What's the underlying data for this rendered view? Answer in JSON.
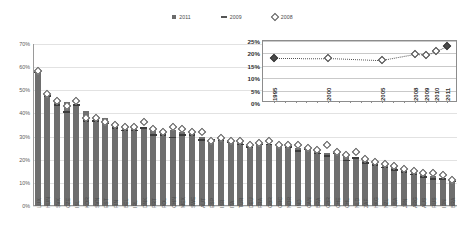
{
  "legend": {
    "items": [
      {
        "label": "2011",
        "marker": "bar-swatch"
      },
      {
        "label": "2009",
        "marker": "dash-marker"
      },
      {
        "label": "2008",
        "marker": "diamond-marker"
      }
    ]
  },
  "chart_data": {
    "type": "bar",
    "title": "",
    "xlabel": "",
    "ylabel": "",
    "ylim": [
      0,
      70
    ],
    "ytick_labels": [
      "0%",
      "10%",
      "20%",
      "30%",
      "40%",
      "50%",
      "60%",
      "70%"
    ],
    "ytick_values": [
      0,
      10,
      20,
      30,
      40,
      50,
      60,
      70
    ],
    "grid": true,
    "legend_position": "top-center",
    "categories": [
      "LUX",
      "HUN",
      "SVK",
      "CZE",
      "ISL",
      "KOR",
      "SVN",
      "EST",
      "FIN",
      "BEL",
      "IRL",
      "DNK",
      "PRT",
      "POL",
      "CHN",
      "MEX",
      "SWE",
      "AUT",
      "ESP",
      "ISR",
      "ITA",
      "TUR",
      "DEU",
      "FRA",
      "GBR",
      "GRC",
      "NOR",
      "IND",
      "CAN",
      "BRA2",
      "GBR2",
      "CHE",
      "CHL",
      "NLD",
      "ZAF",
      "HKG",
      "NZL",
      "USA",
      "JPN",
      "ARG",
      "AUS",
      "RUS",
      "IDN",
      "BRA"
    ],
    "series": [
      {
        "name": "2011",
        "type": "bar",
        "values": [
          58,
          49,
          46,
          45,
          44,
          41,
          39,
          38,
          36,
          35,
          35,
          34,
          34,
          33,
          33,
          32,
          32,
          30,
          29,
          29,
          28,
          28,
          27,
          27,
          27,
          26,
          26,
          25,
          25,
          24,
          23,
          23,
          22,
          21,
          20,
          18,
          18,
          17,
          16,
          15,
          14,
          13,
          12,
          11
        ]
      },
      {
        "name": "2009",
        "type": "dash",
        "values": [
          58,
          48,
          44,
          41,
          44,
          37,
          37,
          36,
          34,
          33,
          33,
          34,
          31,
          31,
          30,
          31,
          31,
          29,
          29,
          29,
          28,
          27,
          26,
          27,
          27,
          27,
          26,
          24,
          25,
          23,
          22,
          23,
          20,
          21,
          19,
          18,
          17,
          16,
          15,
          14,
          13,
          12,
          12,
          11
        ]
      },
      {
        "name": "2008",
        "type": "diamond",
        "values": [
          60,
          50,
          47,
          45,
          47,
          40,
          40,
          38,
          37,
          36,
          36,
          38,
          35,
          34,
          36,
          35,
          34,
          34,
          30,
          31,
          30,
          30,
          28,
          29,
          30,
          28,
          28,
          28,
          27,
          26,
          28,
          25,
          24,
          25,
          22,
          21,
          20,
          19,
          18,
          17,
          16,
          16,
          15,
          13
        ]
      }
    ],
    "inset": {
      "type": "line",
      "title": "",
      "xlabel": "",
      "ylabel": "",
      "ylim": [
        0,
        25
      ],
      "ytick_labels": [
        "0%",
        "5%",
        "10%",
        "15%",
        "20%",
        "25%"
      ],
      "ytick_values": [
        0,
        5,
        10,
        15,
        20,
        25
      ],
      "grid": true,
      "x": [
        "1995",
        "2000",
        "2005",
        "2008",
        "2009",
        "2010",
        "2011"
      ],
      "x_positions": [
        1995,
        2000,
        2005,
        2008,
        2009,
        2010,
        2011
      ],
      "x_domain": [
        1994,
        2012
      ],
      "values": [
        18.2,
        18.1,
        17.2,
        19.6,
        19.4,
        21.0,
        22.8
      ],
      "marker_filled": [
        true,
        false,
        false,
        false,
        false,
        false,
        true
      ],
      "line_style": "dotted"
    }
  }
}
